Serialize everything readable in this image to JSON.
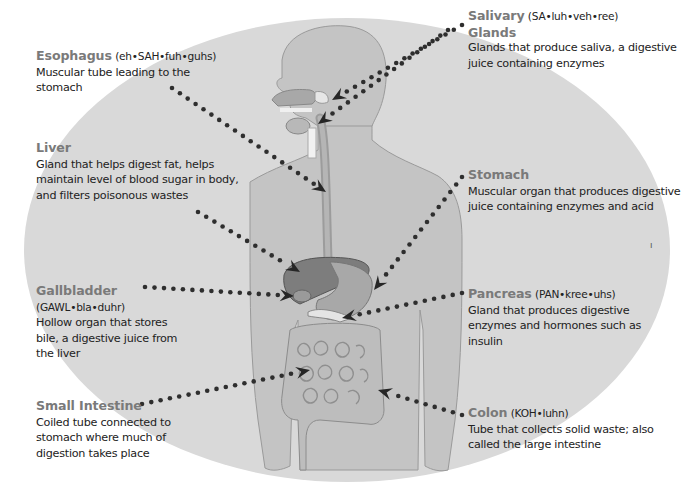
{
  "diagram": {
    "colors": {
      "background_oval": "#d9d9d9",
      "body_fill": "#c4c4c4",
      "body_outline": "#9a9a9a",
      "organ_dark": "#7d7d7d",
      "organ_mid": "#a8a8a8",
      "intestine": "#bdbdbd",
      "dots": "#333333",
      "label_name": "#7a7a7a",
      "label_text": "#222222"
    },
    "labels": [
      {
        "id": "esophagus",
        "name": "Esophagus",
        "pronunciation": "(eh•SAH•fuh•guhs)",
        "description": "Muscular tube leading to the stomach",
        "side": "left"
      },
      {
        "id": "liver",
        "name": "Liver",
        "pronunciation": "",
        "description": "Gland that helps digest fat, helps maintain level of blood sugar in body, and filters poisonous wastes",
        "side": "left"
      },
      {
        "id": "gallbladder",
        "name": "Gallbladder",
        "pronunciation": "(GAWL•bla•duhr)",
        "description": "Hollow organ that stores bile, a digestive juice from the liver",
        "side": "left"
      },
      {
        "id": "small-intestine",
        "name": "Small Intestine",
        "pronunciation": "",
        "description": "Coiled tube connected to stomach where much of digestion takes place",
        "side": "left"
      },
      {
        "id": "salivary-glands",
        "name": "Salivary",
        "pronunciation": "(SA•luh•veh•ree)",
        "name_line2": "Glands",
        "description": "Glands that produce saliva, a digestive juice containing enzymes",
        "side": "right"
      },
      {
        "id": "stomach",
        "name": "Stomach",
        "pronunciation": "",
        "description": "Muscular organ that produces digestive juice containing enzymes and acid",
        "side": "right"
      },
      {
        "id": "pancreas",
        "name": "Pancreas",
        "pronunciation": "(PAN•kree•uhs)",
        "description": "Gland that produces digestive enzymes and hormones such as insulin",
        "side": "right"
      },
      {
        "id": "colon",
        "name": "Colon",
        "pronunciation": "(KOH•luhn)",
        "description": "Tube that collects solid waste; also called the large intestine",
        "side": "right"
      }
    ],
    "stray_mark": "ı"
  }
}
